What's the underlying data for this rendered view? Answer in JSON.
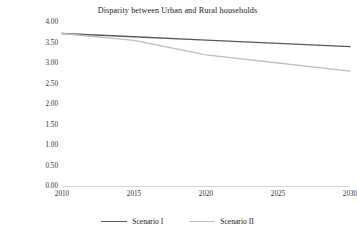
{
  "chart_data": {
    "type": "line",
    "title": "Disparity between Urban and Rural households",
    "xlabel": "",
    "ylabel": "",
    "x": [
      2010,
      2015,
      2020,
      2025,
      2030
    ],
    "xlim": [
      2010,
      2030
    ],
    "ylim": [
      0.0,
      4.0
    ],
    "y_ticks": [
      0.0,
      0.5,
      1.0,
      1.5,
      2.0,
      2.5,
      3.0,
      3.5,
      4.0
    ],
    "y_tick_labels": [
      "0.00",
      "0.50",
      "1.00",
      "1.50",
      "2.00",
      "2.50",
      "3.00",
      "3.50",
      "4.00"
    ],
    "x_tick_labels": [
      "2010",
      "2015",
      "2020",
      "2025",
      "2030"
    ],
    "grid": false,
    "legend_position": "bottom",
    "series": [
      {
        "name": "Scenario I",
        "color": "#595959",
        "values": [
          3.72,
          3.64,
          3.56,
          3.48,
          3.4
        ]
      },
      {
        "name": "Scenario II",
        "color": "#c0c0c0",
        "values": [
          3.72,
          3.55,
          3.2,
          3.0,
          2.8
        ]
      }
    ]
  },
  "legend": {
    "items": [
      {
        "label": "Scenario I",
        "color": "#595959"
      },
      {
        "label": "Scenario II",
        "color": "#c0c0c0"
      }
    ]
  },
  "axis": {
    "line_color": "#d8d8d8"
  }
}
